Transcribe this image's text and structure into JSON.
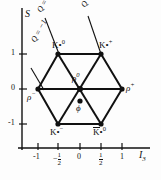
{
  "figure": {
    "type": "meson-nonet-weight-diagram",
    "axes": {
      "x_label": "I",
      "x_sub": "3",
      "y_label": "S",
      "x_ticks": [
        "-1",
        "-½",
        "0",
        "½",
        "1"
      ],
      "x_tick_values": [
        -1,
        -0.5,
        0,
        0.5,
        1
      ],
      "y_ticks": [
        "1",
        "0",
        "-1"
      ],
      "y_tick_values": [
        1,
        0,
        -1
      ],
      "x_range": [
        -1.35,
        1.35
      ],
      "y_range": [
        -1.45,
        1.6
      ]
    },
    "charge_lines": [
      {
        "id": "q-minus-1",
        "label": "Q = -1",
        "text": "Q = −1"
      },
      {
        "id": "q-zero",
        "label": "Q = 0",
        "text": "Q = 0"
      },
      {
        "id": "q-plus-1",
        "label": "Q = +1",
        "text": "Q = +1"
      }
    ],
    "particles": [
      {
        "id": "kstar0",
        "base": "K",
        "star": "*",
        "charge": "0",
        "bar": false,
        "I3": -0.5,
        "S": 1,
        "label": "K*0"
      },
      {
        "id": "kstarplus",
        "base": "K",
        "star": "*",
        "charge": "+",
        "bar": false,
        "I3": 0.5,
        "S": 1,
        "label": "K*+"
      },
      {
        "id": "rhominus",
        "base": "ρ",
        "star": "",
        "charge": "−",
        "bar": false,
        "I3": -1,
        "S": 0,
        "label": "ρ−"
      },
      {
        "id": "rhozero",
        "base": "ρ",
        "star": "",
        "charge": "0",
        "bar": false,
        "I3": 0,
        "S": 0,
        "label": "ρ0"
      },
      {
        "id": "rhoplus",
        "base": "ρ",
        "star": "",
        "charge": "+",
        "bar": false,
        "I3": 1,
        "S": 0,
        "label": "ρ+"
      },
      {
        "id": "phi",
        "base": "φ",
        "star": "",
        "charge": "",
        "bar": false,
        "I3": 0,
        "S": 0,
        "label": "φ"
      },
      {
        "id": "kstarminus",
        "base": "K",
        "star": "*",
        "charge": "−",
        "bar": false,
        "I3": -0.5,
        "S": -1,
        "label": "K*−"
      },
      {
        "id": "kbarstar0",
        "base": "K",
        "star": "*",
        "charge": "0",
        "bar": true,
        "I3": 0.5,
        "S": -1,
        "label": "K̄*0"
      }
    ],
    "labels": {
      "kstar0": "K",
      "kstar0_star": "•",
      "kstar0_sup": "0",
      "kstarplus_sup": "+",
      "kstarminus_sup": "−",
      "kbarstar0_sup": "0",
      "rho": "ρ",
      "rho_minus_sup": "−",
      "rho_zero_sup": "0",
      "rho_plus_sup": "+",
      "phi": "ϕ",
      "star_glyph": "*"
    }
  }
}
